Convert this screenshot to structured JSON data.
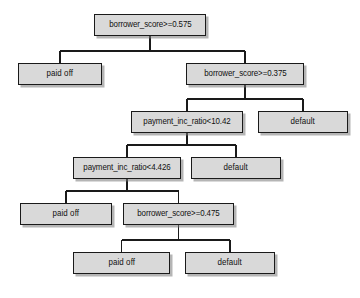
{
  "diagram": {
    "type": "decision-tree",
    "title": "",
    "background_color": "#ffffff",
    "node_fill_color": "#d9d9d9",
    "node_border_color": "#1a1a1a",
    "edge_color": "#1a1a1a",
    "nodes": [
      {
        "id": "n0",
        "label": "borrower_score>=0.575",
        "kind": "split",
        "depth": 0,
        "x": 94,
        "y": 14,
        "w": 112,
        "h": 22
      },
      {
        "id": "n1",
        "label": "paid off",
        "kind": "leaf",
        "depth": 1,
        "x": 18,
        "y": 63,
        "w": 84,
        "h": 22
      },
      {
        "id": "n2",
        "label": "borrower_score>=0.375",
        "kind": "split",
        "depth": 1,
        "x": 186,
        "y": 63,
        "w": 118,
        "h": 22
      },
      {
        "id": "n3",
        "label": "payment_inc_ratio<10.42",
        "kind": "split",
        "depth": 2,
        "x": 131,
        "y": 111,
        "w": 112,
        "h": 22
      },
      {
        "id": "n4",
        "label": "default",
        "kind": "leaf",
        "depth": 2,
        "x": 258,
        "y": 111,
        "w": 90,
        "h": 22
      },
      {
        "id": "n5",
        "label": "payment_inc_ratio<4.426",
        "kind": "split",
        "depth": 3,
        "x": 73,
        "y": 157,
        "w": 108,
        "h": 22
      },
      {
        "id": "n6",
        "label": "default",
        "kind": "leaf",
        "depth": 3,
        "x": 191,
        "y": 157,
        "w": 90,
        "h": 22
      },
      {
        "id": "n7",
        "label": "paid off",
        "kind": "leaf",
        "depth": 4,
        "x": 20,
        "y": 203,
        "w": 92,
        "h": 22
      },
      {
        "id": "n8",
        "label": "borrower_score>=0.475",
        "kind": "split",
        "depth": 4,
        "x": 123,
        "y": 203,
        "w": 111,
        "h": 22
      },
      {
        "id": "n9",
        "label": "paid off",
        "kind": "leaf",
        "depth": 5,
        "x": 73,
        "y": 252,
        "w": 97,
        "h": 22
      },
      {
        "id": "n10",
        "label": "default",
        "kind": "leaf",
        "depth": 5,
        "x": 185,
        "y": 252,
        "w": 90,
        "h": 22
      }
    ],
    "edges": [
      {
        "from": "n0",
        "to": "n1"
      },
      {
        "from": "n0",
        "to": "n2"
      },
      {
        "from": "n2",
        "to": "n3"
      },
      {
        "from": "n2",
        "to": "n4"
      },
      {
        "from": "n3",
        "to": "n5"
      },
      {
        "from": "n3",
        "to": "n6"
      },
      {
        "from": "n5",
        "to": "n7"
      },
      {
        "from": "n5",
        "to": "n8"
      },
      {
        "from": "n8",
        "to": "n9"
      },
      {
        "from": "n8",
        "to": "n10"
      }
    ]
  }
}
